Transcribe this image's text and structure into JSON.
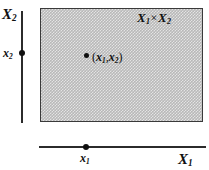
{
  "figure": {
    "colors": {
      "line": "#2b2b2b",
      "region_fill": "#b8b8b8",
      "region_border": "#3a3a3a",
      "text": "#111111",
      "background": "#ffffff"
    }
  },
  "axes": {
    "vertical": {
      "name": "X",
      "subscript": "2",
      "tick": {
        "name": "x",
        "subscript": "2"
      }
    },
    "horizontal": {
      "name": "X",
      "subscript": "1",
      "tick": {
        "name": "x",
        "subscript": "1"
      }
    }
  },
  "region": {
    "label_left": "X",
    "label_left_sub": "1",
    "label_times": "×",
    "label_right": "X",
    "label_right_sub": "2",
    "fill_pattern": "fine-checkerboard-gray"
  },
  "point": {
    "open_paren": "(",
    "first": "x",
    "first_sub": "1",
    "comma": ",",
    "second": "x",
    "second_sub": "2",
    "close_paren": ")"
  }
}
